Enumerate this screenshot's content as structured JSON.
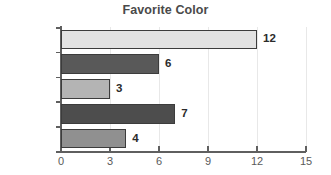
{
  "chart_data": {
    "type": "bar",
    "orientation": "horizontal",
    "title": "Favorite Color",
    "xlabel": "",
    "ylabel": "",
    "categories": [
      "Cyan",
      "Purple",
      "Green",
      "Red",
      "Blue"
    ],
    "values": [
      12,
      6,
      3,
      7,
      4
    ],
    "value_labels": [
      "12",
      "6",
      "3",
      "7",
      "4"
    ],
    "bar_colors": [
      "#e2e2e2",
      "#595959",
      "#b4b4b4",
      "#4d4d4d",
      "#909090"
    ],
    "bar_border_color": "#3c3c3c",
    "xlim": [
      0,
      15
    ],
    "xticks": [
      0,
      3,
      6,
      9,
      12,
      15
    ],
    "xtick_labels": [
      "0",
      "3",
      "6",
      "9",
      "12",
      "15"
    ],
    "grid": true,
    "grid_axis": "x",
    "legend": false,
    "background": "#ffffff",
    "title_color": "#4a4a4a",
    "tick_label_color": "#5a5a5a",
    "category_label_color": "#4f4f4f"
  }
}
